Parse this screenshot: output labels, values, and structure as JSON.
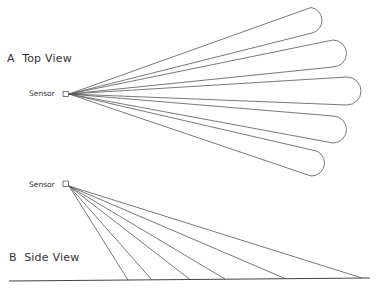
{
  "diagram": {
    "top_view": {
      "letter": "A",
      "title": "Top View",
      "sensor_label": "Sensor",
      "lobe_count": 5
    },
    "side_view": {
      "letter": "B",
      "title": "Side View",
      "sensor_label": "Sensor",
      "beam_count": 6
    },
    "colors": {
      "stroke": "#555555",
      "text": "#333333",
      "background": "#ffffff"
    }
  }
}
